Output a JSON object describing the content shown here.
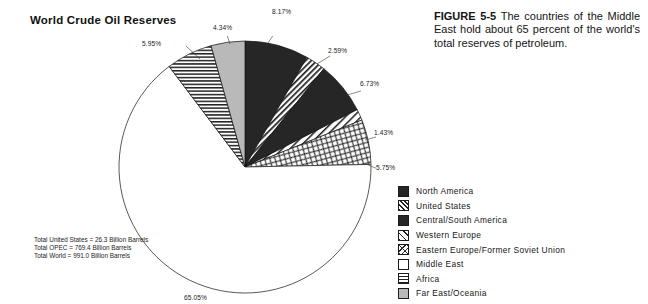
{
  "chart_title": "World Crude Oil Reserves",
  "figure_caption": {
    "label": "FIGURE 5-5",
    "text": "The countries of the Middle East hold about 65 percent of the world's total reserves of petroleum."
  },
  "footnote": {
    "line1": "Total United States = 26.3 Billion Barrels",
    "line2": "Total OPEC = 769.4 Billion Barrels",
    "line3": "Total World = 991.0 Billion Barrels"
  },
  "legend": {
    "items": [
      {
        "label": "North America",
        "swatch": "solid-dark-icon",
        "color": "#262626"
      },
      {
        "label": "United  States",
        "swatch": "dense-diagonal-hatch-icon",
        "color": "#1f1f1f"
      },
      {
        "label": "Central/South  America",
        "swatch": "solid-dark-icon",
        "color": "#262626"
      },
      {
        "label": "Western  Europe",
        "swatch": "wide-diagonal-hatch-icon",
        "color": "#1f1f1f"
      },
      {
        "label": "Eastern  Europe/Former  Soviet  Union",
        "swatch": "cross-texture-icon",
        "color": "#2a2a2a"
      },
      {
        "label": "Middle  East",
        "swatch": "white-fill-icon",
        "color": "#ffffff"
      },
      {
        "label": "Africa",
        "swatch": "horizontal-lines-icon",
        "color": "#1f1f1f"
      },
      {
        "label": "Far  East/Oceania",
        "swatch": "gray-fill-icon",
        "color": "#b9b9b9"
      }
    ]
  },
  "pct_labels": {
    "north_america": "8.17%",
    "united_states": "2.59%",
    "central_south_america": "6.73%",
    "western_europe": "1.43%",
    "eastern_europe": "5.75%",
    "middle_east": "65.05%",
    "africa": "5.95%",
    "far_east_oceania": "4.34%"
  },
  "chart_data": {
    "type": "pie",
    "title": "World Crude Oil Reserves",
    "xlabel": "",
    "ylabel": "",
    "grid": false,
    "legend_position": "right-bottom",
    "units": "percent of world crude oil reserves",
    "start_angle_deg": 0,
    "direction": "clockwise",
    "labels": [
      "North America",
      "United States",
      "Central/South America",
      "Western Europe",
      "Eastern Europe/Former Soviet Union",
      "Middle East",
      "Africa",
      "Far East/Oceania"
    ],
    "values": [
      8.17,
      2.59,
      6.73,
      1.43,
      5.75,
      65.05,
      5.95,
      4.34
    ],
    "value_labels": [
      "8.17%",
      "2.59%",
      "6.73%",
      "1.43%",
      "5.75%",
      "65.05%",
      "5.95%",
      "4.34%"
    ],
    "patterns": [
      "solid-dark",
      "dense-diagonal-hatch",
      "solid-dark",
      "wide-diagonal-hatch",
      "cross-texture",
      "white-fill",
      "horizontal-lines",
      "gray-fill"
    ],
    "annotations": [
      "Total United States = 26.3 Billion Barrels",
      "Total OPEC = 769.4 Billion Barrels",
      "Total World = 991.0 Billion Barrels"
    ]
  }
}
